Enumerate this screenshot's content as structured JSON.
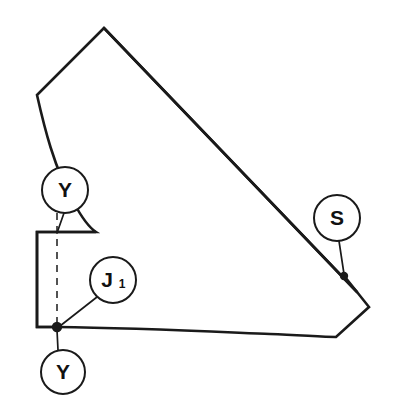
{
  "diagram": {
    "canvas": {
      "width": 393,
      "height": 414,
      "background": "#ffffff"
    },
    "line_color": "#1a1a1a",
    "fill_color": "#ffffff",
    "shape": {
      "name": "pattern-piece-outline",
      "description": "Irregular polygon pattern piece: peaked top, long diagonal right edge, notched lower-left rectangle, gently curved bottom edge",
      "vertices": [
        {
          "label": "apex",
          "x": 104,
          "y": 28
        },
        {
          "label": "upper-left-vertex",
          "x": 37,
          "y": 95
        },
        {
          "label": "curve-control-left",
          "x": 52,
          "y": 170
        },
        {
          "label": "notch-top-right",
          "x": 96,
          "y": 232
        },
        {
          "label": "notch-top-left",
          "x": 37,
          "y": 232
        },
        {
          "label": "notch-bottom-left",
          "x": 37,
          "y": 327
        },
        {
          "label": "junction-J1",
          "x": 57,
          "y": 327
        },
        {
          "label": "bottom-dip",
          "x": 336,
          "y": 337
        },
        {
          "label": "right-point",
          "x": 369,
          "y": 307
        },
        {
          "label": "right-notch-vertex",
          "x": 345,
          "y": 277
        },
        {
          "label": "diagonal-end",
          "x": 357,
          "y": 292
        }
      ]
    },
    "callouts": [
      {
        "id": "callout-y-upper",
        "label": "Y",
        "subscript": "",
        "circle": {
          "cx": 65,
          "cy": 190,
          "r": 23
        },
        "leader": {
          "x1": 65,
          "y1": 213,
          "x2": 57,
          "y2": 233
        },
        "has_dot": false
      },
      {
        "id": "callout-s",
        "label": "S",
        "subscript": "",
        "circle": {
          "cx": 337,
          "cy": 218,
          "r": 23
        },
        "leader": {
          "x1": 340,
          "y1": 241,
          "x2": 344,
          "y2": 275
        },
        "has_dot": true,
        "dot": {
          "cx": 344,
          "cy": 276,
          "r": 4
        }
      },
      {
        "id": "callout-j1",
        "label": "J",
        "subscript": "1",
        "circle": {
          "cx": 113,
          "cy": 280,
          "r": 23
        },
        "leader": {
          "x1": 97,
          "y1": 297,
          "x2": 59,
          "y2": 326
        },
        "has_dot": true,
        "dot": {
          "cx": 57,
          "cy": 327,
          "r": 5
        }
      },
      {
        "id": "callout-y-lower",
        "label": "Y",
        "subscript": "",
        "circle": {
          "cx": 63,
          "cy": 372,
          "r": 22
        },
        "leader": {
          "x1": 58,
          "y1": 350,
          "x2": 57,
          "y2": 329
        },
        "has_dot": false
      }
    ],
    "construction_line": {
      "name": "grain-dashed-line",
      "style": "dashed",
      "x1": 57,
      "y1": 213,
      "x2": 57,
      "y2": 326
    }
  }
}
